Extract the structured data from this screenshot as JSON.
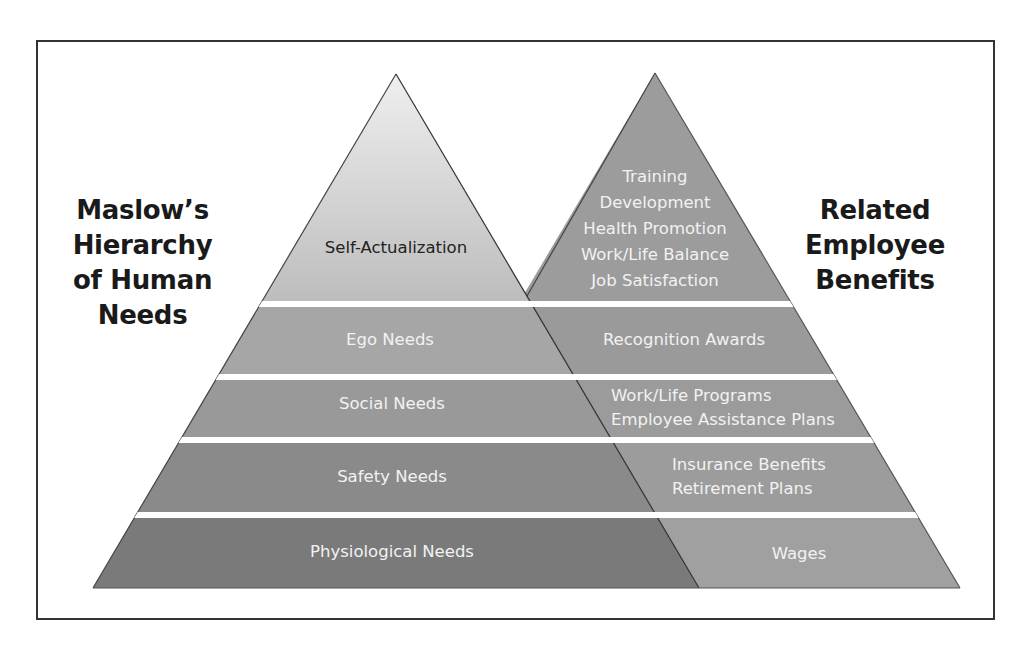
{
  "left_title": {
    "lines": [
      "Maslow’s",
      "Hierarchy",
      "of Human",
      "Needs"
    ]
  },
  "right_title": {
    "lines": [
      "Related",
      "Employee",
      "Benefits"
    ]
  },
  "maslow_levels": [
    {
      "label": "Self-Actualization"
    },
    {
      "label": "Ego Needs"
    },
    {
      "label": "Social Needs"
    },
    {
      "label": "Safety Needs"
    },
    {
      "label": "Physiological Needs"
    }
  ],
  "benefits_levels": [
    {
      "lines": [
        "Training",
        "Development",
        "Health Promotion",
        "Work/Life Balance",
        "Job Satisfaction"
      ]
    },
    {
      "lines": [
        "Recognition Awards"
      ]
    },
    {
      "lines": [
        "Work/Life Programs",
        "Employee Assistance Plans"
      ]
    },
    {
      "lines": [
        "Insurance Benefits",
        "Retirement Plans"
      ]
    },
    {
      "lines": [
        "Wages"
      ]
    }
  ],
  "colors": {
    "frame_border": "#333333",
    "left_band_fills": [
      "#c9c9c9",
      "#a6a6a6",
      "#999999",
      "#8a8a8a",
      "#7a7a7a"
    ],
    "right_band_fills": [
      "#9c9c9c",
      "#9a9a9a",
      "#9b9b9b",
      "#9c9c9c",
      "#a0a0a0"
    ],
    "band_text": "#f2f2f2",
    "title_text": "#1a1a1a"
  }
}
